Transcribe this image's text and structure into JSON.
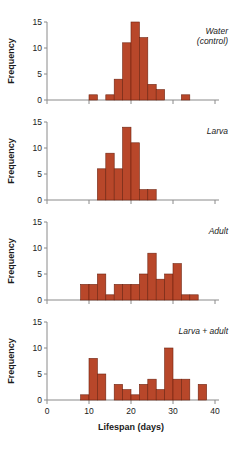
{
  "figure": {
    "xlabel": "Lifespan (days)",
    "ylabel": "Frequency",
    "bar_color": "#B8472A",
    "bar_edge_color": "#6E2310",
    "axis_color": "#8A8A8A",
    "text_color": "#1A1A1A"
  },
  "chart_data": [
    {
      "type": "bar",
      "title": "Water (control)",
      "panel_label_line1": "Water",
      "panel_label_line2": "(control)",
      "xlabel": "Lifespan (days)",
      "ylabel": "Frequency",
      "xlim": [
        0,
        40
      ],
      "ylim": [
        0,
        15
      ],
      "xticks": [
        0,
        10,
        20,
        30,
        40
      ],
      "yticks": [
        0,
        5,
        10,
        15
      ],
      "bin_width": 2,
      "grid": false,
      "bins": [
        {
          "x0": 10,
          "x1": 12,
          "value": 1
        },
        {
          "x0": 14,
          "x1": 16,
          "value": 1
        },
        {
          "x0": 16,
          "x1": 18,
          "value": 4
        },
        {
          "x0": 18,
          "x1": 20,
          "value": 11
        },
        {
          "x0": 20,
          "x1": 22,
          "value": 15
        },
        {
          "x0": 22,
          "x1": 24,
          "value": 12
        },
        {
          "x0": 24,
          "x1": 26,
          "value": 3
        },
        {
          "x0": 26,
          "x1": 28,
          "value": 2
        },
        {
          "x0": 32,
          "x1": 34,
          "value": 1
        }
      ]
    },
    {
      "type": "bar",
      "title": "Larva",
      "panel_label_line1": "Larva",
      "panel_label_line2": "",
      "xlabel": "Lifespan (days)",
      "ylabel": "Frequency",
      "xlim": [
        0,
        40
      ],
      "ylim": [
        0,
        15
      ],
      "xticks": [
        0,
        10,
        20,
        30,
        40
      ],
      "yticks": [
        0,
        5,
        10,
        15
      ],
      "bin_width": 2,
      "grid": false,
      "bins": [
        {
          "x0": 12,
          "x1": 14,
          "value": 6
        },
        {
          "x0": 14,
          "x1": 16,
          "value": 9
        },
        {
          "x0": 16,
          "x1": 18,
          "value": 6
        },
        {
          "x0": 18,
          "x1": 20,
          "value": 14
        },
        {
          "x0": 20,
          "x1": 22,
          "value": 11
        },
        {
          "x0": 22,
          "x1": 24,
          "value": 2
        },
        {
          "x0": 24,
          "x1": 26,
          "value": 2
        }
      ]
    },
    {
      "type": "bar",
      "title": "Adult",
      "panel_label_line1": "Adult",
      "panel_label_line2": "",
      "xlabel": "Lifespan (days)",
      "ylabel": "Frequency",
      "xlim": [
        0,
        40
      ],
      "ylim": [
        0,
        15
      ],
      "xticks": [
        0,
        10,
        20,
        30,
        40
      ],
      "yticks": [
        0,
        5,
        10,
        15
      ],
      "bin_width": 2,
      "grid": false,
      "bins": [
        {
          "x0": 8,
          "x1": 10,
          "value": 3
        },
        {
          "x0": 10,
          "x1": 12,
          "value": 3
        },
        {
          "x0": 12,
          "x1": 14,
          "value": 5
        },
        {
          "x0": 14,
          "x1": 16,
          "value": 1
        },
        {
          "x0": 16,
          "x1": 18,
          "value": 3
        },
        {
          "x0": 18,
          "x1": 20,
          "value": 3
        },
        {
          "x0": 20,
          "x1": 22,
          "value": 3
        },
        {
          "x0": 22,
          "x1": 24,
          "value": 5
        },
        {
          "x0": 24,
          "x1": 26,
          "value": 9
        },
        {
          "x0": 26,
          "x1": 28,
          "value": 4
        },
        {
          "x0": 28,
          "x1": 30,
          "value": 5
        },
        {
          "x0": 30,
          "x1": 32,
          "value": 7
        },
        {
          "x0": 32,
          "x1": 34,
          "value": 1
        },
        {
          "x0": 34,
          "x1": 36,
          "value": 1
        }
      ]
    },
    {
      "type": "bar",
      "title": "Larva + adult",
      "panel_label_line1": "Larva + adult",
      "panel_label_line2": "",
      "xlabel": "Lifespan (days)",
      "ylabel": "Frequency",
      "xlim": [
        0,
        40
      ],
      "ylim": [
        0,
        15
      ],
      "xticks": [
        0,
        10,
        20,
        30,
        40
      ],
      "yticks": [
        0,
        5,
        10,
        15
      ],
      "bin_width": 2,
      "grid": false,
      "bins": [
        {
          "x0": 8,
          "x1": 10,
          "value": 1
        },
        {
          "x0": 10,
          "x1": 12,
          "value": 8
        },
        {
          "x0": 12,
          "x1": 14,
          "value": 5
        },
        {
          "x0": 16,
          "x1": 18,
          "value": 3
        },
        {
          "x0": 18,
          "x1": 20,
          "value": 2
        },
        {
          "x0": 20,
          "x1": 22,
          "value": 1
        },
        {
          "x0": 22,
          "x1": 24,
          "value": 3
        },
        {
          "x0": 24,
          "x1": 26,
          "value": 4
        },
        {
          "x0": 26,
          "x1": 28,
          "value": 2
        },
        {
          "x0": 28,
          "x1": 30,
          "value": 10
        },
        {
          "x0": 30,
          "x1": 32,
          "value": 4
        },
        {
          "x0": 32,
          "x1": 34,
          "value": 4
        },
        {
          "x0": 36,
          "x1": 38,
          "value": 3
        }
      ]
    }
  ]
}
